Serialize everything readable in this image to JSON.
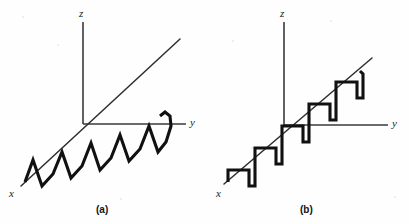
{
  "figure": {
    "background_color": "#fefefe",
    "ink_color": "#111111",
    "axis_color": "#3a3a3a",
    "panels": [
      {
        "id": "a",
        "caption": "(a)",
        "caption_pos": {
          "x": 96,
          "y": 205
        },
        "axes": {
          "z": {
            "label": "z",
            "label_pos": {
              "x": 79,
              "y": 8
            },
            "from": {
              "x": 83,
              "y": 22
            },
            "to": {
              "x": 83,
              "y": 124
            }
          },
          "y": {
            "label": "y",
            "label_pos": {
              "x": 190,
              "y": 117
            },
            "from": {
              "x": 83,
              "y": 124
            },
            "to": {
              "x": 186,
              "y": 124
            }
          },
          "x": {
            "label": "x",
            "label_pos": {
              "x": 9,
              "y": 188
            },
            "from": {
              "x": 21,
              "y": 186
            },
            "to": {
              "x": 180,
              "y": 39
            }
          }
        },
        "wave": {
          "type": "sawtooth",
          "description": "triangular sawtooth oscillation about the x-axis diagonal",
          "cycles": 4,
          "amplitude_px": 18,
          "period_px": 38
        }
      },
      {
        "id": "b",
        "caption": "(b)",
        "caption_pos": {
          "x": 300,
          "y": 205
        },
        "axes": {
          "z": {
            "label": "z",
            "label_pos": {
              "x": 280,
              "y": 8
            },
            "from": {
              "x": 284,
              "y": 22
            },
            "to": {
              "x": 284,
              "y": 125
            }
          },
          "y": {
            "label": "y",
            "label_pos": {
              "x": 392,
              "y": 118
            },
            "from": {
              "x": 284,
              "y": 125
            },
            "to": {
              "x": 388,
              "y": 125
            }
          },
          "x": {
            "label": "x",
            "label_pos": {
              "x": 216,
              "y": 188
            },
            "from": {
              "x": 224,
              "y": 184
            },
            "to": {
              "x": 372,
              "y": 58
            }
          }
        },
        "wave": {
          "type": "square",
          "description": "square-wave staircase oscillation about the x-axis diagonal",
          "cycles": 4,
          "amplitude_px": 16,
          "period_px": 36
        }
      }
    ]
  }
}
